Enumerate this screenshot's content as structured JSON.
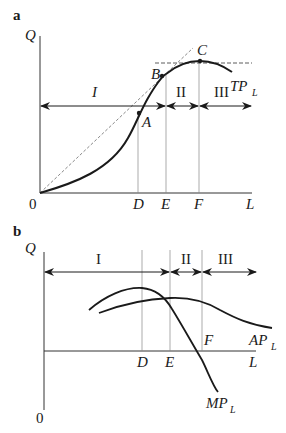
{
  "panel_a": {
    "letter": "a",
    "y_axis_label": "Q",
    "x_axis_label": "L",
    "origin_label": "0",
    "x_ticks": [
      "D",
      "E",
      "F"
    ],
    "points": [
      "A",
      "B",
      "C"
    ],
    "curve_label": "TP",
    "curve_subscript": "L",
    "stages": [
      "I",
      "II",
      "III"
    ]
  },
  "panel_b": {
    "letter": "b",
    "y_axis_label": "Q",
    "x_axis_label": "L",
    "origin_label": "0",
    "x_ticks": [
      "D",
      "E"
    ],
    "point_label": "F",
    "curves": [
      {
        "label": "AP",
        "subscript": "L"
      },
      {
        "label": "MP",
        "subscript": "L"
      }
    ],
    "stages": [
      "I",
      "II",
      "III"
    ]
  },
  "colors": {
    "line": "#1a1a1a",
    "guide": "#888888",
    "background": "#ffffff"
  }
}
